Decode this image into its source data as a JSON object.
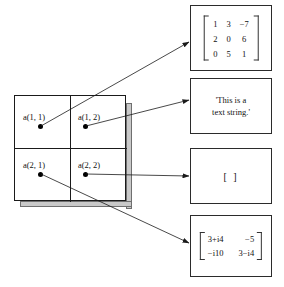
{
  "diagram": {
    "cell_array": {
      "name": "a",
      "rows": 2,
      "cols": 2,
      "cells": [
        {
          "label": "a(1, 1)",
          "points_to": "matrix"
        },
        {
          "label": "a(1, 2)",
          "points_to": "string"
        },
        {
          "label": "a(2, 1)",
          "points_to": "complex"
        },
        {
          "label": "a(2, 2)",
          "points_to": "empty"
        }
      ]
    },
    "values": {
      "matrix": {
        "kind": "numeric-matrix",
        "rows": [
          [
            "1",
            "3",
            "−7"
          ],
          [
            "2",
            "0",
            "6"
          ],
          [
            "0",
            "5",
            "1"
          ]
        ]
      },
      "string": {
        "kind": "character-string",
        "line1": "'This is a",
        "line2": "text string.'"
      },
      "empty": {
        "kind": "empty-matrix",
        "text": "[ ]"
      },
      "complex": {
        "kind": "complex-matrix",
        "rows": [
          [
            "3+i4",
            "−5"
          ],
          [
            "−i10",
            "3−i4"
          ]
        ]
      }
    },
    "colors": {
      "line": "#1a1a1a",
      "box_border": "#2b2b2b",
      "shadow": "#c9c9c9",
      "dot": "#000000",
      "background": "#ffffff"
    }
  }
}
